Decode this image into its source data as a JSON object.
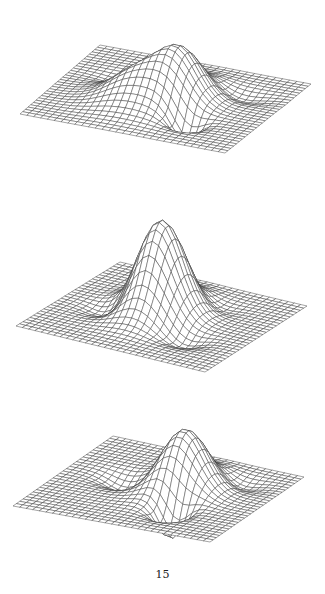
{
  "page": {
    "page_number": "15"
  },
  "chart_data": [
    {
      "type": "surface-wireframe",
      "title": "",
      "description": "3D wireframe surface with two positive lobes and a negative dip near the front corner",
      "grid": {
        "nx": 30,
        "ny": 30
      },
      "x_range": [
        -3,
        3
      ],
      "y_range": [
        -3,
        3
      ],
      "terms": [
        {
          "cx": 0.4,
          "cy": -0.2,
          "amp": 1.35,
          "sx": 0.55,
          "sy": 0.9
        },
        {
          "cx": -0.6,
          "cy": 0.5,
          "amp": 0.9,
          "sx": 0.7,
          "sy": 0.8
        },
        {
          "cx": 1.1,
          "cy": 1.3,
          "amp": -0.7,
          "sx": 0.35,
          "sy": 0.35
        },
        {
          "cx": -1.2,
          "cy": -0.7,
          "amp": -0.25,
          "sx": 0.6,
          "sy": 0.35
        },
        {
          "cx": 1.6,
          "cy": -1.3,
          "amp": -0.2,
          "sx": 0.6,
          "sy": 0.35
        }
      ]
    },
    {
      "type": "surface-wireframe",
      "title": "",
      "description": "3D wireframe surface with a single tall central peak and shallow dips on left and right",
      "grid": {
        "nx": 30,
        "ny": 30
      },
      "x_range": [
        -3,
        3
      ],
      "y_range": [
        -3,
        3
      ],
      "terms": [
        {
          "cx": -0.2,
          "cy": -0.3,
          "amp": 1.9,
          "sx": 0.65,
          "sy": 0.85
        },
        {
          "cx": -1.3,
          "cy": 0.5,
          "amp": -0.25,
          "sx": 0.5,
          "sy": 0.4
        },
        {
          "cx": 1.2,
          "cy": 1.1,
          "amp": -0.22,
          "sx": 0.5,
          "sy": 0.4
        },
        {
          "cx": 0.8,
          "cy": -1.4,
          "amp": -0.15,
          "sx": 0.5,
          "sy": 0.4
        }
      ]
    },
    {
      "type": "surface-wireframe",
      "title": "",
      "description": "3D wireframe surface with a positive peak behind and a negative trough in front",
      "grid": {
        "nx": 30,
        "ny": 30
      },
      "x_range": [
        -3,
        3
      ],
      "y_range": [
        -3,
        3
      ],
      "terms": [
        {
          "cx": 0.5,
          "cy": -0.5,
          "amp": 1.45,
          "sx": 0.6,
          "sy": 0.85
        },
        {
          "cx": 0.9,
          "cy": 1.1,
          "amp": -0.9,
          "sx": 0.35,
          "sy": 0.45
        },
        {
          "cx": -1.2,
          "cy": -0.2,
          "amp": -0.3,
          "sx": 0.5,
          "sy": 0.4
        },
        {
          "cx": 1.6,
          "cy": -1.6,
          "amp": -0.2,
          "sx": 0.5,
          "sy": 0.4
        }
      ]
    }
  ]
}
